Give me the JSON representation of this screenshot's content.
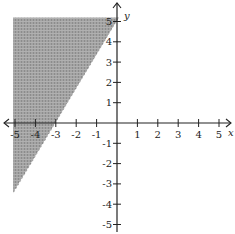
{
  "chart_data": {
    "type": "inequality-graph",
    "title": "",
    "xlabel": "x",
    "ylabel": "y",
    "xlim": [
      -5,
      5
    ],
    "ylim": [
      -5,
      5
    ],
    "grid": false,
    "x_ticks": [
      -5,
      -4,
      -3,
      -2,
      -1,
      1,
      2,
      3,
      4,
      5
    ],
    "y_ticks": [
      -5,
      -4,
      -3,
      -2,
      -1,
      1,
      2,
      3,
      4,
      5
    ],
    "x_tick_labels": [
      "-5",
      "-4",
      "-3",
      "-2",
      "-1",
      "1",
      "2",
      "3",
      "4",
      "5"
    ],
    "y_tick_labels": [
      "-5",
      "-4",
      "-3",
      "-2",
      "-1",
      "1",
      "2",
      "3",
      "4",
      "5"
    ],
    "boundary": {
      "style": "dashed",
      "equation": "y = (5/3)x + 5",
      "points": [
        [
          -5.1,
          -3.5
        ],
        [
          -3,
          0
        ],
        [
          0,
          5
        ]
      ]
    },
    "inequality": "y > (5/3)x + 5",
    "shaded_region": "above-left of boundary line",
    "shaded_polygon": [
      [
        -5.1,
        5.2
      ],
      [
        0.1,
        5.2
      ],
      [
        -5.1,
        -3.5
      ]
    ],
    "colors": {
      "shade": "#9a9a9a",
      "axis": "#222222",
      "background": "#ffffff"
    }
  }
}
